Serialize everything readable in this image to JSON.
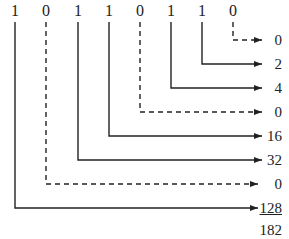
{
  "diagram": {
    "bits": [
      "1",
      "0",
      "1",
      "1",
      "0",
      "1",
      "1",
      "0"
    ],
    "place_values": [
      "0",
      "2",
      "4",
      "0",
      "16",
      "32",
      "0",
      "128"
    ],
    "sum": "182",
    "line_color": "#222222",
    "bit_x": [
      15,
      46,
      78,
      109,
      140,
      171,
      202,
      233
    ],
    "row_y": [
      40,
      64,
      88,
      112,
      136,
      160,
      184,
      208
    ]
  }
}
